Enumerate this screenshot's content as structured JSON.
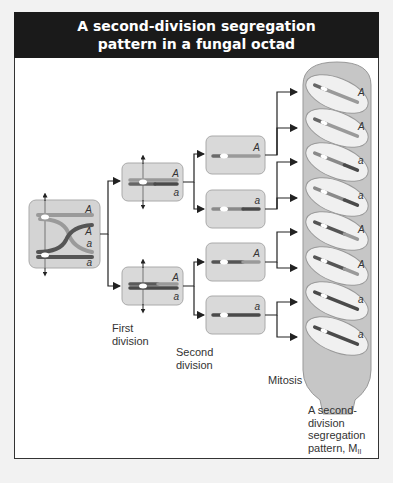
{
  "title": {
    "line1": "A second-division segregation",
    "line2": "pattern in a fungal octad"
  },
  "stages": {
    "first_division": [
      "First",
      "division"
    ],
    "second_division": [
      "Second",
      "division"
    ],
    "mitosis": "Mitosis"
  },
  "result_label": {
    "line1": "A second-",
    "line2": "division",
    "line3": "segregation",
    "line4": "pattern, M",
    "subscript": "II"
  },
  "meiosis_cell": {
    "alleles": [
      "A",
      "A",
      "a",
      "a"
    ]
  },
  "first_division_cells": [
    {
      "alleles": [
        "A",
        "a"
      ]
    },
    {
      "alleles": [
        "A",
        "a"
      ]
    }
  ],
  "second_division_cells": [
    {
      "allele": "A"
    },
    {
      "allele": "a"
    },
    {
      "allele": "A"
    },
    {
      "allele": "a"
    }
  ],
  "octad_spores": [
    "A",
    "A",
    "a",
    "a",
    "A",
    "A",
    "a",
    "a"
  ],
  "colors": {
    "header_bg": "#1a1a1a",
    "cell_fill": "#dcdcdc",
    "light_chromosome": "#9a9a9a",
    "dark_chromosome": "#4a4a4a",
    "ascus_fill": "#c8c8c8"
  }
}
